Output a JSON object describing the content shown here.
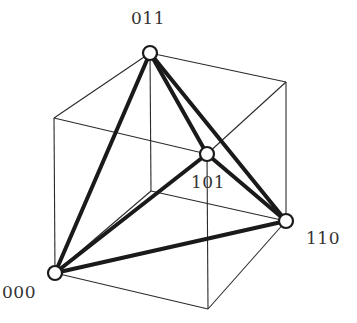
{
  "diagram": {
    "vertices": {
      "000": {
        "label": "000",
        "x": 55,
        "y": 273
      },
      "011": {
        "label": "011",
        "x": 150,
        "y": 53
      },
      "101": {
        "label": "101",
        "x": 207,
        "y": 154
      },
      "110": {
        "label": "110",
        "x": 286,
        "y": 221
      }
    },
    "labels": [
      {
        "id": "011",
        "text": "011",
        "x": 131,
        "y": 8
      },
      {
        "id": "101",
        "text": "101",
        "x": 191,
        "y": 172
      },
      {
        "id": "110",
        "text": "110",
        "x": 306,
        "y": 228
      },
      {
        "id": "000",
        "text": "000",
        "x": 2,
        "y": 282
      }
    ],
    "colors": {
      "thin_line": "#2a2a2a",
      "thick_line": "#1a1a1a",
      "node_fill": "#ffffff",
      "text": "#333333"
    }
  }
}
